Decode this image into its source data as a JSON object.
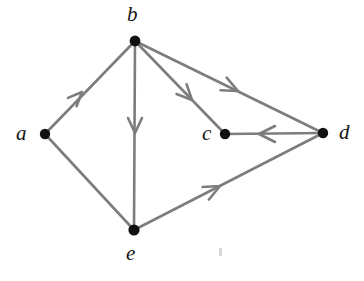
{
  "figure": {
    "type": "directed-graph",
    "background_color": "#ffffff",
    "edge_color": "#7d7d7d",
    "node_color": "#111111",
    "label_color": "#141414",
    "edge_width": 2.6,
    "node_radius": 5.0,
    "width": 364,
    "height": 281
  },
  "nodes": [
    {
      "id": "a",
      "label": "a",
      "cx": 45,
      "cy": 134,
      "label_x": 16,
      "label_y": 123
    },
    {
      "id": "b",
      "label": "b",
      "cx": 135,
      "cy": 41,
      "label_x": 127,
      "label_y": 4
    },
    {
      "id": "c",
      "label": "c",
      "cx": 225,
      "cy": 134,
      "label_x": 202,
      "label_y": 123
    },
    {
      "id": "d",
      "label": "d",
      "cx": 323,
      "cy": 133,
      "label_x": 339,
      "label_y": 122
    },
    {
      "id": "e",
      "label": "e",
      "cx": 134,
      "cy": 230,
      "label_x": 126,
      "label_y": 243
    }
  ],
  "edges": [
    {
      "id": "a-b",
      "from": "a",
      "to": "b",
      "directed": true,
      "arrow_x": 82,
      "arrow_y": 92,
      "label": "a to b"
    },
    {
      "id": "b-e",
      "from": "b",
      "to": "e",
      "directed": true,
      "arrow_x": 135,
      "arrow_y": 133,
      "label": "b to e"
    },
    {
      "id": "b-c",
      "from": "b",
      "to": "c",
      "directed": true,
      "arrow_x": 192,
      "arrow_y": 100,
      "label": "b to c"
    },
    {
      "id": "b-d",
      "from": "b",
      "to": "d",
      "directed": true,
      "arrow_x": 238,
      "arrow_y": 92,
      "label": "b to d"
    },
    {
      "id": "d-c",
      "from": "d",
      "to": "c",
      "directed": true,
      "arrow_x": 259,
      "arrow_y": 134,
      "label": "d to c"
    },
    {
      "id": "e-d",
      "from": "e",
      "to": "d",
      "directed": true,
      "arrow_x": 219,
      "arrow_y": 188,
      "label": "e to d"
    },
    {
      "id": "a-e",
      "from": "a",
      "to": "e",
      "directed": false,
      "arrow_x": 0,
      "arrow_y": 0,
      "label": "a to e"
    }
  ],
  "artifact": {
    "name": "speck",
    "x": 219,
    "y": 248,
    "width": 3,
    "height": 8,
    "color": "#d8d8d8"
  }
}
